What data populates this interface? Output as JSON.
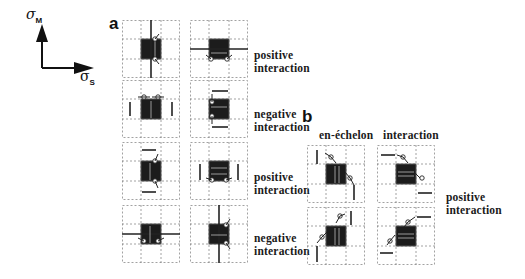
{
  "figure": {
    "axes": {
      "vertical_label": "σ",
      "vertical_sub": "M",
      "horizontal_label": "σ",
      "horizontal_sub": "S"
    },
    "panel_a": {
      "letter": "a",
      "rows": [
        {
          "label_line1": "positive",
          "label_line2": "interaction"
        },
        {
          "label_line1": "negative",
          "label_line2": "interaction"
        },
        {
          "label_line1": "positive",
          "label_line2": "interaction"
        },
        {
          "label_line1": "negative",
          "label_line2": "interaction"
        }
      ]
    },
    "panel_b": {
      "letter": "b",
      "column_headers": [
        "en-échelon",
        "interaction"
      ],
      "side_label_line1": "positive",
      "side_label_line2": "interaction"
    },
    "colors": {
      "block": "#1c1c1c",
      "grid": "#8a8a8a",
      "line": "#222222",
      "background": "#ffffff"
    }
  }
}
